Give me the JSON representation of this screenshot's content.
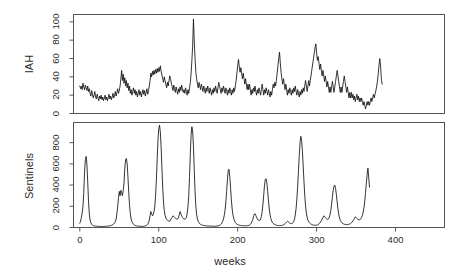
{
  "chart_data": {
    "type": "line",
    "title": "",
    "xlabel": "weeks",
    "layout": {
      "panels": 2,
      "grid": false,
      "legend": "none",
      "shared_x_axis": true,
      "stacked_vertically": true
    },
    "x": {
      "label": "weeks",
      "ticks": [
        0,
        100,
        200,
        300,
        400
      ],
      "tick_labels": [
        "0",
        "100",
        "200",
        "300",
        "400"
      ],
      "xlim": [
        -8,
        462
      ]
    },
    "panels": [
      {
        "name": "IAH",
        "ylabel": "IAH",
        "ylim": [
          0,
          108
        ],
        "ticks": [
          0,
          20,
          40,
          60,
          80,
          100
        ],
        "tick_labels": [
          "0",
          "20",
          "40",
          "60",
          "80",
          "100"
        ],
        "series_name": "IAH",
        "color": "#111111",
        "notable_peaks": [
          {
            "week": 153,
            "value": 103
          },
          {
            "week": 318,
            "value": 76
          },
          {
            "week": 268,
            "value": 67
          },
          {
            "week": 215,
            "value": 59
          },
          {
            "week": 424,
            "value": 60
          },
          {
            "week": 110,
            "value": 52
          },
          {
            "week": 55,
            "value": 47
          }
        ],
        "values": [
          30,
          27,
          30,
          26,
          33,
          29,
          26,
          31,
          28,
          25,
          30,
          24,
          27,
          22,
          19,
          25,
          21,
          17,
          20,
          24,
          18,
          16,
          21,
          17,
          14,
          19,
          16,
          20,
          15,
          18,
          14,
          17,
          20,
          15,
          18,
          14,
          17,
          21,
          16,
          19,
          15,
          18,
          22,
          17,
          20,
          24,
          19,
          23,
          27,
          22,
          25,
          30,
          38,
          47,
          36,
          43,
          33,
          39,
          30,
          36,
          28,
          33,
          25,
          30,
          22,
          26,
          20,
          24,
          28,
          22,
          26,
          20,
          24,
          18,
          22,
          26,
          20,
          24,
          18,
          22,
          26,
          21,
          25,
          19,
          23,
          27,
          21,
          25,
          30,
          36,
          44,
          40,
          46,
          42,
          47,
          43,
          48,
          44,
          49,
          45,
          50,
          46,
          52,
          46,
          42,
          38,
          34,
          40,
          36,
          32,
          28,
          34,
          30,
          36,
          41,
          37,
          33,
          29,
          25,
          31,
          27,
          23,
          29,
          25,
          21,
          27,
          23,
          29,
          25,
          31,
          27,
          23,
          26,
          22,
          28,
          24,
          20,
          26,
          22,
          28,
          34,
          44,
          58,
          75,
          103,
          78,
          60,
          45,
          38,
          32,
          28,
          34,
          30,
          26,
          32,
          28,
          24,
          30,
          26,
          22,
          28,
          24,
          30,
          26,
          22,
          28,
          24,
          20,
          26,
          22,
          28,
          24,
          30,
          26,
          22,
          28,
          34,
          30,
          26,
          22,
          28,
          24,
          30,
          26,
          22,
          28,
          24,
          20,
          26,
          22,
          28,
          24,
          20,
          26,
          22,
          28,
          24,
          30,
          36,
          44,
          52,
          59,
          51,
          45,
          50,
          44,
          38,
          44,
          38,
          32,
          38,
          32,
          26,
          32,
          26,
          32,
          26,
          20,
          26,
          22,
          28,
          24,
          30,
          24,
          20,
          26,
          22,
          28,
          24,
          20,
          26,
          32,
          26,
          20,
          26,
          22,
          28,
          24,
          20,
          26,
          22,
          18,
          24,
          20,
          26,
          32,
          28,
          34,
          30,
          36,
          44,
          52,
          60,
          67,
          55,
          45,
          38,
          32,
          38,
          32,
          26,
          32,
          26,
          20,
          26,
          22,
          28,
          24,
          20,
          26,
          22,
          28,
          24,
          30,
          24,
          20,
          26,
          22,
          18,
          24,
          20,
          26,
          22,
          28,
          24,
          30,
          36,
          30,
          24,
          30,
          36,
          30,
          36,
          42,
          48,
          54,
          60,
          66,
          72,
          76,
          66,
          58,
          62,
          55,
          48,
          54,
          47,
          41,
          47,
          41,
          35,
          41,
          35,
          29,
          35,
          29,
          23,
          29,
          23,
          29,
          35,
          29,
          23,
          29,
          35,
          41,
          47,
          41,
          35,
          29,
          23,
          29,
          23,
          29,
          35,
          41,
          35,
          29,
          23,
          29,
          23,
          17,
          23,
          17,
          23,
          17,
          21,
          15,
          19,
          13,
          17,
          21,
          15,
          19,
          13,
          17,
          13,
          17,
          13,
          9,
          13,
          9,
          5,
          9,
          13,
          9,
          13,
          9,
          13,
          17,
          13,
          17,
          21,
          17,
          21,
          25,
          29,
          35,
          43,
          52,
          60,
          52,
          38,
          32
        ]
      },
      {
        "name": "Sentinels",
        "ylabel": "Sentinels",
        "ylim": [
          0,
          990
        ],
        "ticks": [
          0,
          200,
          400,
          600,
          800
        ],
        "tick_labels": [
          "0",
          "200",
          "400",
          "600",
          "800"
        ],
        "series_name": "Sentinels",
        "color": "#111111",
        "notable_peaks": [
          {
            "week": 8,
            "value": 670
          },
          {
            "week": 60,
            "value": 650
          },
          {
            "week": 56,
            "value": 350
          },
          {
            "week": 110,
            "value": 965
          },
          {
            "week": 153,
            "value": 950
          },
          {
            "week": 215,
            "value": 550
          },
          {
            "week": 251,
            "value": 130
          },
          {
            "week": 270,
            "value": 460
          },
          {
            "week": 318,
            "value": 860
          },
          {
            "week": 372,
            "value": 400
          },
          {
            "week": 427,
            "value": 560
          }
        ],
        "values": [
          40,
          60,
          95,
          140,
          200,
          330,
          520,
          640,
          670,
          600,
          430,
          250,
          130,
          70,
          45,
          30,
          22,
          18,
          15,
          14,
          13,
          12,
          12,
          11,
          11,
          10,
          10,
          10,
          10,
          10,
          10,
          11,
          11,
          12,
          12,
          13,
          14,
          15,
          16,
          18,
          20,
          24,
          28,
          34,
          42,
          55,
          80,
          130,
          200,
          280,
          340,
          300,
          350,
          330,
          300,
          350,
          420,
          560,
          640,
          650,
          600,
          470,
          330,
          210,
          130,
          80,
          55,
          40,
          30,
          24,
          20,
          17,
          15,
          14,
          13,
          12,
          12,
          11,
          11,
          11,
          11,
          12,
          13,
          15,
          18,
          22,
          30,
          45,
          70,
          110,
          150,
          130,
          110,
          120,
          150,
          200,
          300,
          450,
          640,
          820,
          930,
          965,
          900,
          760,
          560,
          380,
          240,
          160,
          115,
          90,
          75,
          68,
          62,
          58,
          60,
          70,
          85,
          95,
          110,
          105,
          95,
          88,
          82,
          78,
          80,
          95,
          120,
          150,
          130,
          110,
          95,
          85,
          80,
          78,
          82,
          95,
          130,
          200,
          300,
          480,
          700,
          880,
          950,
          900,
          760,
          540,
          340,
          200,
          120,
          80,
          58,
          44,
          35,
          29,
          25,
          22,
          20,
          19,
          18,
          17,
          16,
          15,
          15,
          14,
          14,
          13,
          13,
          13,
          12,
          12,
          12,
          12,
          12,
          13,
          14,
          15,
          17,
          20,
          25,
          32,
          42,
          58,
          80,
          115,
          165,
          240,
          340,
          450,
          540,
          550,
          480,
          370,
          260,
          175,
          120,
          85,
          62,
          48,
          38,
          32,
          27,
          24,
          22,
          20,
          19,
          18,
          18,
          17,
          17,
          16,
          16,
          16,
          17,
          18,
          20,
          24,
          30,
          40,
          55,
          75,
          100,
          125,
          130,
          115,
          95,
          80,
          70,
          65,
          68,
          80,
          105,
          150,
          220,
          310,
          400,
          455,
          460,
          420,
          340,
          250,
          175,
          120,
          85,
          62,
          48,
          38,
          32,
          27,
          24,
          22,
          20,
          19,
          18,
          18,
          18,
          19,
          20,
          22,
          25,
          30,
          36,
          44,
          52,
          58,
          55,
          48,
          42,
          38,
          36,
          38,
          45,
          58,
          80,
          120,
          180,
          270,
          390,
          530,
          680,
          800,
          860,
          820,
          720,
          580,
          430,
          300,
          200,
          135,
          95,
          70,
          54,
          44,
          37,
          32,
          28,
          25,
          23,
          22,
          21,
          21,
          22,
          24,
          28,
          34,
          42,
          52,
          66,
          80,
          95,
          110,
          105,
          95,
          85,
          78,
          75,
          80,
          95,
          120,
          160,
          220,
          290,
          350,
          390,
          400,
          370,
          310,
          240,
          175,
          125,
          90,
          68,
          54,
          44,
          38,
          34,
          31,
          29,
          28,
          27,
          27,
          28,
          30,
          33,
          38,
          44,
          52,
          62,
          74,
          88,
          100,
          95,
          85,
          78,
          74,
          72,
          75,
          82,
          95,
          115,
          145,
          190,
          250,
          330,
          420,
          500,
          560,
          470,
          380
        ]
      }
    ]
  },
  "axis_titles": {
    "iah": "IAH",
    "sentinels": "Sentinels",
    "x": "weeks"
  }
}
